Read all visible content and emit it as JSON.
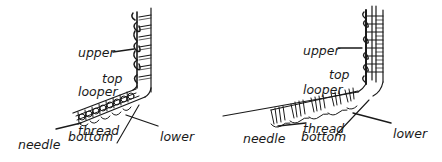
{
  "figure": {
    "panels": [
      {
        "id": "left",
        "stitch_style": "rolled loops",
        "labels": {
          "upper_looper": [
            "upper",
            "looper",
            "thread"
          ],
          "top": "top",
          "needle": [
            "needle",
            "thread"
          ],
          "bottom": "bottom",
          "lower_looper": [
            "lower",
            "looper",
            "thread"
          ]
        }
      },
      {
        "id": "right",
        "stitch_style": "wrapped ladder",
        "labels": {
          "upper_looper": [
            "upper",
            "looper",
            "thread"
          ],
          "top": "top",
          "needle": [
            "needle",
            "thread"
          ],
          "bottom": "bottom",
          "lower_looper": [
            "lower",
            "looper",
            "thread"
          ]
        }
      }
    ],
    "colors": {
      "ink": "#1a1a1a",
      "background": "#ffffff"
    }
  }
}
